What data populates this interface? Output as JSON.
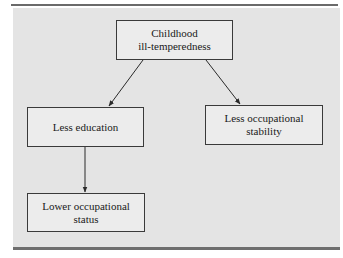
{
  "diagram": {
    "type": "causal-flow",
    "nodes": [
      {
        "id": "root",
        "lines": [
          "Childhood",
          "ill-temperedness"
        ]
      },
      {
        "id": "education",
        "lines": [
          "Less education"
        ]
      },
      {
        "id": "stability",
        "lines": [
          "Less occupational",
          "stability"
        ]
      },
      {
        "id": "status",
        "lines": [
          "Lower occupational",
          "status"
        ]
      }
    ],
    "edges": [
      {
        "from": "root",
        "to": "education"
      },
      {
        "from": "root",
        "to": "stability"
      },
      {
        "from": "education",
        "to": "status"
      }
    ]
  },
  "colors": {
    "panel": "#e4e4e4",
    "box_fill": "#ececec",
    "box_border": "#3a3a3a",
    "rule": "#6a6a6a",
    "arrow": "#2a2a2a"
  }
}
